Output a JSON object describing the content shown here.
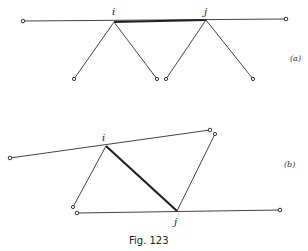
{
  "figure": {
    "caption": "Fig. 123",
    "panel_a": {
      "label": "(a)",
      "node_i": "i",
      "node_j": "j",
      "main_line": {
        "x1": 23,
        "y1": 21,
        "x2": 286,
        "y2": 19
      },
      "i_point": {
        "x": 114,
        "y": 22
      },
      "j_point": {
        "x": 206,
        "y": 20
      },
      "legs": [
        {
          "x1": 114,
          "y1": 22,
          "x2": 74,
          "y2": 79
        },
        {
          "x1": 114,
          "y1": 22,
          "x2": 157,
          "y2": 79
        },
        {
          "x1": 206,
          "y1": 20,
          "x2": 166,
          "y2": 79
        },
        {
          "x1": 206,
          "y1": 20,
          "x2": 253,
          "y2": 79
        }
      ]
    },
    "panel_b": {
      "label": "(b)",
      "node_i": "i",
      "node_j": "j",
      "upper_line": {
        "x1": 10,
        "y1": 158,
        "x2": 210,
        "y2": 130
      },
      "lower_line": {
        "x1": 77,
        "y1": 213,
        "x2": 280,
        "y2": 210
      },
      "i_point": {
        "x": 106,
        "y": 146
      },
      "j_point": {
        "x": 177,
        "y": 211
      },
      "legs": [
        {
          "x1": 106,
          "y1": 146,
          "x2": 73,
          "y2": 207
        },
        {
          "x1": 177,
          "y1": 211,
          "x2": 215,
          "y2": 134
        }
      ]
    }
  }
}
